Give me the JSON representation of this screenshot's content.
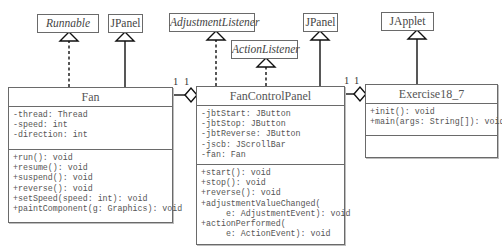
{
  "diagram": {
    "type": "UML class diagram",
    "supertypes": {
      "runnable": {
        "name": "Runnable",
        "kind": "interface"
      },
      "jpanel_fan": {
        "name": "JPanel",
        "kind": "class"
      },
      "adjustment_listener": {
        "name": "AdjustmentListener",
        "kind": "interface"
      },
      "action_listener": {
        "name": "ActionListener",
        "kind": "interface"
      },
      "jpanel_control": {
        "name": "JPanel",
        "kind": "class"
      },
      "japplet": {
        "name": "JApplet",
        "kind": "class"
      }
    },
    "classes": {
      "fan": {
        "name": "Fan",
        "fields": [
          "-thread: Thread",
          "-speed: int",
          "-direction: int"
        ],
        "methods": [
          "+run(): void",
          "+resume(): void",
          "+suspend(): void",
          "+reverse(): void",
          "+setSpeed(speed: int): void",
          "+paintComponent(g: Graphics): void"
        ]
      },
      "fan_control_panel": {
        "name": "FanControlPanel",
        "fields": [
          "-jbtStart: JButton",
          "-jbtStop: JButton",
          "-jbtReverse: JButton",
          "-jscb: JScrollBar",
          "-fan: Fan"
        ],
        "methods": [
          "+start(): void",
          "+stop(): void",
          "+reverse(): void",
          "+adjustmentValueChanged(",
          "     e: AdjustmentEvent): void",
          "+actionPerformed(",
          "     e: ActionEvent): void"
        ]
      },
      "exercise": {
        "name": "Exercise18_7",
        "fields": [],
        "methods": [
          "+init(): void",
          "+main(args: String[]): void"
        ]
      }
    },
    "relationships": [
      {
        "from": "Fan",
        "to": "Runnable",
        "type": "realization"
      },
      {
        "from": "Fan",
        "to": "JPanel",
        "type": "generalization"
      },
      {
        "from": "FanControlPanel",
        "to": "AdjustmentListener",
        "type": "realization"
      },
      {
        "from": "FanControlPanel",
        "to": "ActionListener",
        "type": "realization"
      },
      {
        "from": "FanControlPanel",
        "to": "JPanel",
        "type": "generalization"
      },
      {
        "from": "Exercise18_7",
        "to": "JApplet",
        "type": "generalization"
      },
      {
        "whole": "FanControlPanel",
        "part": "Fan",
        "type": "aggregation",
        "multiplicity": [
          "1",
          "1"
        ]
      },
      {
        "whole": "Exercise18_7",
        "part": "FanControlPanel",
        "type": "aggregation",
        "multiplicity": [
          "1",
          "1"
        ]
      }
    ],
    "multiplicities": {
      "fan_left": "1",
      "fan_right": "1",
      "panel_left": "1",
      "panel_right": "1"
    }
  }
}
